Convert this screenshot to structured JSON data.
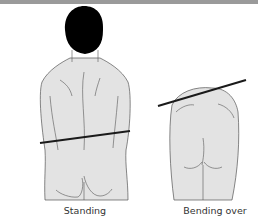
{
  "illustration": {
    "panels": [
      {
        "id": "standing",
        "label": "Standing"
      },
      {
        "id": "bending",
        "label": "Bending over"
      }
    ],
    "colors": {
      "top_bar": "#9a9a9a",
      "skin_fill": "#e3e3e3",
      "outline": "#555555",
      "hair": "#000000",
      "reference_line": "#1a1a1a"
    }
  }
}
